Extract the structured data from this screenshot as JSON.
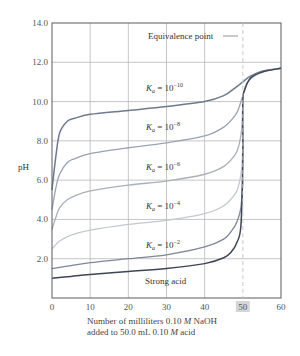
{
  "chart_data": {
    "type": "line",
    "title": "",
    "xlabel": "Number of milliliters 0.10 M NaOH added to 50.0 mL 0.10 M acid",
    "xlabel_lines": [
      "Number of milliliters 0.10 ",
      "M",
      " NaOH",
      "added to 50.0 mL 0.10 ",
      "M",
      " acid"
    ],
    "ylabel": "pH",
    "xlim": [
      0,
      60
    ],
    "ylim": [
      0,
      14
    ],
    "x_ticks": [
      "0",
      "10",
      "20",
      "30",
      "40",
      "50",
      "60"
    ],
    "y_ticks": [
      "2.0",
      "4.0",
      "6.0",
      "8.0",
      "10.0",
      "12.0",
      "14.0"
    ],
    "highlighted_x_tick": "50",
    "grid": true,
    "annotations": [
      {
        "text": "Equivalence point",
        "x": 50,
        "style": "dashed vertical line"
      }
    ],
    "series": [
      {
        "name": "Ka = 10^-10",
        "label_main": "K",
        "label_sub": "a",
        "label_eq": " = 10",
        "label_exp": "−10",
        "color": "#6e7b8e",
        "x": [
          0,
          1,
          2,
          4,
          6,
          10,
          20,
          30,
          40,
          45,
          48,
          50,
          52,
          55,
          60
        ],
        "y": [
          5.5,
          7.2,
          8.4,
          9.0,
          9.15,
          9.35,
          9.55,
          9.75,
          10.0,
          10.3,
          10.7,
          11.0,
          11.3,
          11.55,
          11.7
        ]
      },
      {
        "name": "Ka = 10^-8",
        "label_main": "K",
        "label_sub": "a",
        "label_eq": " = 10",
        "label_exp": "−8",
        "color": "#9aa3b0",
        "x": [
          0,
          1,
          2,
          4,
          6,
          10,
          20,
          30,
          40,
          45,
          48,
          49,
          50,
          51,
          53,
          56,
          60
        ],
        "y": [
          4.5,
          5.6,
          6.3,
          6.9,
          7.1,
          7.35,
          7.65,
          7.9,
          8.25,
          8.7,
          9.3,
          9.7,
          10.3,
          10.9,
          11.3,
          11.55,
          11.7
        ]
      },
      {
        "name": "Ka = 10^-6",
        "label_main": "K",
        "label_sub": "a",
        "label_eq": " = 10",
        "label_exp": "−6",
        "color": "#a9b0ba",
        "x": [
          0,
          1,
          2,
          4,
          6,
          10,
          20,
          30,
          40,
          45,
          48,
          49,
          49.7,
          50
        ],
        "y": [
          3.5,
          4.1,
          4.6,
          5.0,
          5.2,
          5.45,
          5.75,
          5.95,
          6.3,
          6.7,
          7.3,
          7.8,
          8.6,
          10.0
        ]
      },
      {
        "name": "Ka = 10^-4",
        "label_main": "K",
        "label_sub": "a",
        "label_eq": " = 10",
        "label_exp": "−4",
        "color": "#c3c8cf",
        "x": [
          0,
          2,
          5,
          10,
          20,
          30,
          40,
          45,
          48,
          49,
          49.7,
          50
        ],
        "y": [
          2.5,
          2.9,
          3.2,
          3.45,
          3.75,
          3.95,
          4.3,
          4.7,
          5.3,
          5.8,
          6.6,
          8.0
        ]
      },
      {
        "name": "Ka = 10^-2",
        "label_main": "K",
        "label_sub": "a",
        "label_eq": " = 10",
        "label_exp": "−2",
        "color": "#7d8797",
        "x": [
          0,
          5,
          10,
          20,
          30,
          40,
          45,
          47,
          48.5,
          49.5,
          50
        ],
        "y": [
          1.5,
          1.65,
          1.8,
          2.0,
          2.2,
          2.6,
          3.0,
          3.4,
          3.9,
          4.6,
          6.0
        ]
      },
      {
        "name": "Strong acid",
        "label_main": "Strong acid",
        "color": "#3e4654",
        "x": [
          0,
          5,
          10,
          20,
          30,
          40,
          45,
          47,
          48.5,
          49.5,
          50,
          50,
          50.5,
          52,
          55,
          60
        ],
        "y": [
          1.0,
          1.1,
          1.2,
          1.35,
          1.5,
          1.75,
          2.05,
          2.35,
          2.85,
          3.7,
          7.0,
          10.0,
          10.6,
          11.2,
          11.5,
          11.7
        ]
      }
    ]
  }
}
